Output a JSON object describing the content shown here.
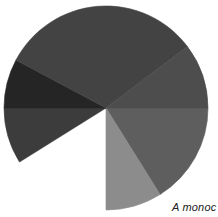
{
  "chart_data": {
    "type": "pie",
    "title": "",
    "caption": "A monoc",
    "center": [
      106,
      108
    ],
    "radius": 102,
    "start_angle_deg": 0,
    "direction": "clockwise",
    "legend": "none",
    "slices": [
      {
        "label": "Slice 1",
        "start_deg": 0,
        "end_deg": 58,
        "percent": 16.1,
        "color": "#5e5e5e"
      },
      {
        "label": "Slice 2",
        "start_deg": 58,
        "end_deg": 90,
        "percent": 8.9,
        "color": "#8c8c8c"
      },
      {
        "label": "Missing wedge",
        "start_deg": 90,
        "end_deg": 148,
        "percent": 16.1,
        "color": "#ffffff",
        "missing": true
      },
      {
        "label": "Slice 3",
        "start_deg": 148,
        "end_deg": 180,
        "percent": 8.9,
        "color": "#3c3c3c"
      },
      {
        "label": "Slice 4",
        "start_deg": 180,
        "end_deg": 208,
        "percent": 7.8,
        "color": "#252525"
      },
      {
        "label": "Slice 5",
        "start_deg": 208,
        "end_deg": 323,
        "percent": 31.9,
        "color": "#434343"
      },
      {
        "label": "Slice 6",
        "start_deg": 323,
        "end_deg": 360,
        "percent": 10.3,
        "color": "#4d4d4d"
      }
    ]
  }
}
